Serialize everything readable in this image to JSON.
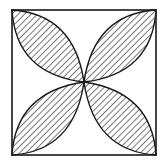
{
  "diagram": {
    "type": "geometry-figure",
    "square": {
      "x": 12,
      "y": 10,
      "width": 144,
      "height": 145
    },
    "center": {
      "x": 84,
      "y": 82
    },
    "petals": [
      {
        "id": "top-left",
        "from": [
          12,
          10
        ],
        "to": [
          84,
          82
        ]
      },
      {
        "id": "top-right",
        "from": [
          156,
          10
        ],
        "to": [
          84,
          82
        ]
      },
      {
        "id": "bottom-left",
        "from": [
          12,
          155
        ],
        "to": [
          84,
          82
        ]
      },
      {
        "id": "bottom-right",
        "from": [
          156,
          155
        ],
        "to": [
          84,
          82
        ]
      }
    ],
    "hatch": {
      "direction": "diagonal-down-right",
      "spacing": 4.5
    },
    "colors": {
      "stroke": "#1a1a1a",
      "hatch": "#333333",
      "background": "#ffffff"
    }
  }
}
